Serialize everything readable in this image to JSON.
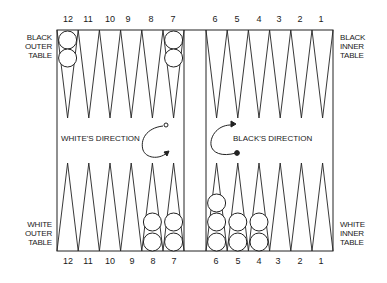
{
  "board": {
    "top_numbers": [
      "12",
      "11",
      "10",
      "9",
      "8",
      "7",
      "6",
      "5",
      "4",
      "3",
      "2",
      "1"
    ],
    "bottom_numbers": [
      "12",
      "11",
      "10",
      "9",
      "8",
      "7",
      "6",
      "5",
      "4",
      "3",
      "2",
      "1"
    ],
    "labels": {
      "black_outer": [
        "BLACK",
        "OUTER",
        "TABLE"
      ],
      "black_inner": [
        "BLACK",
        "INNER",
        "TABLE"
      ],
      "white_outer": [
        "WHITE",
        "OUTER",
        "TABLE"
      ],
      "white_inner": [
        "WHITE",
        "INNER",
        "TABLE"
      ]
    },
    "directions": {
      "white": "WHITE'S DIRECTION",
      "black": "BLACK'S DIRECTION"
    },
    "checkers_top": {
      "12": 2,
      "7": 2
    },
    "checkers_bottom": {
      "8": 2,
      "7": 2,
      "6": 3,
      "5": 2,
      "4": 2
    },
    "colors": {
      "line": "#222222",
      "background": "#ffffff"
    }
  }
}
